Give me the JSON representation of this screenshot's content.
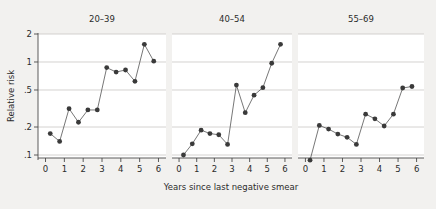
{
  "figure": {
    "background_color": "#f2f1ef",
    "panel_background_color": "#ffffff",
    "marker_color": "#3a3a3a",
    "line_color": "#4a4a4a",
    "gridline_color": "#c9c7c4",
    "axis_color": "#4a4a4a"
  },
  "chart_data": {
    "type": "line",
    "title": "",
    "xlabel": "Years since last negative smear",
    "ylabel": "Relative risk",
    "yscale": "log",
    "ylim": [
      0.085,
      2.2
    ],
    "xlim": [
      -0.4,
      6.4
    ],
    "grid": true,
    "legend_position": "none",
    "ytick_values": [
      2,
      1,
      0.5,
      0.2,
      0.1
    ],
    "ytick_labels": [
      "2",
      "1",
      ".5",
      ".2",
      ".1"
    ],
    "xtick_values": [
      0,
      1,
      2,
      3,
      4,
      5,
      6
    ],
    "xtick_labels": [
      "0",
      "1",
      "2",
      "3",
      "4",
      "5",
      "6"
    ],
    "x": [
      0.25,
      0.75,
      1.25,
      1.75,
      2.25,
      2.75,
      3.25,
      3.75,
      4.25,
      4.75,
      5.25,
      5.75
    ],
    "panels": [
      {
        "title": "20–39",
        "values": [
          0.17,
          0.14,
          0.315,
          0.225,
          0.305,
          0.305,
          0.87,
          0.78,
          0.82,
          0.62,
          1.55,
          1.02
        ]
      },
      {
        "title": "40–54",
        "values": [
          0.1,
          0.132,
          0.185,
          0.17,
          0.165,
          0.13,
          0.565,
          0.285,
          0.44,
          0.53,
          0.97,
          1.55
        ]
      },
      {
        "title": "55–69",
        "values": [
          0.088,
          0.208,
          0.19,
          0.168,
          0.155,
          0.13,
          0.275,
          0.245,
          0.205,
          0.275,
          0.525,
          0.545
        ]
      }
    ]
  }
}
